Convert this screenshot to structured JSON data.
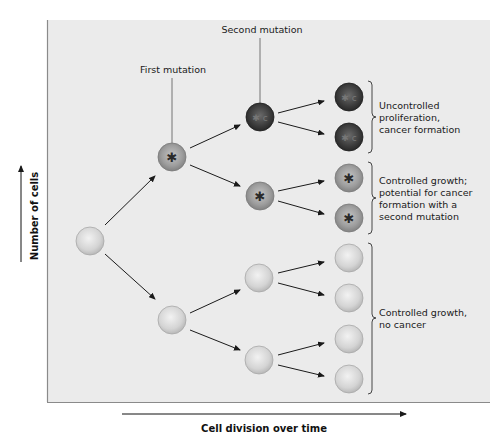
{
  "diagram": {
    "type": "cell-lineage-tree",
    "colors": {
      "panel_bg": "#ebebeb",
      "panel_border": "#8a8a8a",
      "normal_cell": "#d6d6d6",
      "mutated_cell": "#9c9c9c",
      "cancer_cell": "#3e3e3e",
      "arrow": "#1a1a1a"
    },
    "annotations": {
      "first_mutation": "First mutation",
      "second_mutation": "Second mutation"
    },
    "groups": [
      {
        "lines": [
          "Uncontrolled",
          "proliferation,",
          "cancer formation"
        ]
      },
      {
        "lines": [
          "Controlled growth;",
          "potential for cancer",
          "formation with a",
          "second  mutation"
        ]
      },
      {
        "lines": [
          "Controlled growth,",
          "no cancer"
        ]
      }
    ],
    "axes": {
      "y_label": "Number of cells",
      "x_label": "Cell division over time"
    },
    "generations": [
      {
        "index": 0,
        "cells": [
          "normal"
        ]
      },
      {
        "index": 1,
        "cells": [
          "one-mutation",
          "normal"
        ]
      },
      {
        "index": 2,
        "cells": [
          "two-mutations",
          "one-mutation",
          "normal",
          "normal"
        ]
      },
      {
        "index": 3,
        "cells": [
          "two-mutations",
          "two-mutations",
          "one-mutation",
          "one-mutation",
          "normal",
          "normal",
          "normal",
          "normal"
        ]
      }
    ]
  }
}
